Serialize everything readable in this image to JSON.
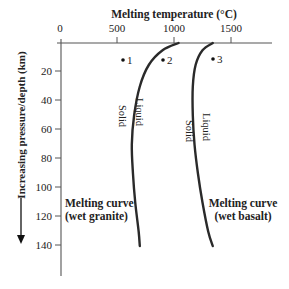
{
  "chart_data": {
    "type": "line",
    "title": "Melting temperature (°C)",
    "xlabel": "Melting temperature (°C)",
    "ylabel": "Increasing pressure/depth (km)",
    "x_axis_position": "top",
    "y_axis_inverted": true,
    "xlim": [
      0,
      1850
    ],
    "ylim": [
      0,
      160
    ],
    "xticks": [
      0,
      500,
      1000,
      1500
    ],
    "xtick_labels": [
      "0",
      "500",
      "1000",
      "1500"
    ],
    "yticks": [
      20,
      40,
      60,
      80,
      100,
      120,
      140
    ],
    "ytick_labels": [
      "20",
      "40",
      "60",
      "80",
      "100",
      "120",
      "140"
    ],
    "grid": false,
    "legend": null,
    "series": [
      {
        "name": "Melting curve (wet granite)",
        "label_lines": [
          "Melting curve",
          "(wet granite)"
        ],
        "side_labels": {
          "left": "Solid",
          "right": "Liquid"
        },
        "points": [
          {
            "temp": 1040,
            "depth": 0
          },
          {
            "temp": 900,
            "depth": 5
          },
          {
            "temp": 780,
            "depth": 15
          },
          {
            "temp": 700,
            "depth": 30
          },
          {
            "temp": 650,
            "depth": 50
          },
          {
            "temp": 630,
            "depth": 70
          },
          {
            "temp": 640,
            "depth": 90
          },
          {
            "temp": 660,
            "depth": 110
          },
          {
            "temp": 690,
            "depth": 130
          },
          {
            "temp": 700,
            "depth": 140
          }
        ]
      },
      {
        "name": "Melting curve (wet basalt)",
        "label_lines": [
          "Melting curve",
          "(wet basalt)"
        ],
        "side_labels": {
          "left": "Solid",
          "right": "Liquid"
        },
        "points": [
          {
            "temp": 1340,
            "depth": 0
          },
          {
            "temp": 1250,
            "depth": 5
          },
          {
            "temp": 1190,
            "depth": 15
          },
          {
            "temp": 1165,
            "depth": 30
          },
          {
            "temp": 1165,
            "depth": 50
          },
          {
            "temp": 1180,
            "depth": 70
          },
          {
            "temp": 1210,
            "depth": 90
          },
          {
            "temp": 1250,
            "depth": 110
          },
          {
            "temp": 1300,
            "depth": 130
          },
          {
            "temp": 1340,
            "depth": 140
          }
        ]
      }
    ],
    "annotations": [
      {
        "label": "1",
        "temp": 550,
        "depth": 12
      },
      {
        "label": "2",
        "temp": 900,
        "depth": 12
      },
      {
        "label": "3",
        "temp": 1340,
        "depth": 11
      }
    ]
  }
}
